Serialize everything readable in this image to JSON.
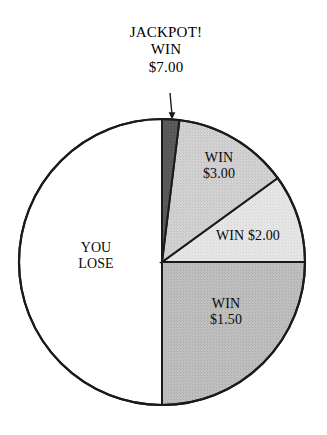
{
  "chart_data": {
    "type": "pie",
    "title": "",
    "legend_position": "none",
    "grid": false,
    "start_angle_deg": 0,
    "direction": "clockwise",
    "center": {
      "x": 162,
      "y": 262
    },
    "radius": 143,
    "total_degrees": 360,
    "categories": [
      "JACKPOT! WIN $7.00",
      "WIN $3.00",
      "WIN $2.00",
      "WIN $1.50",
      "YOU LOSE"
    ],
    "values": [
      7,
      47,
      36,
      90,
      180
    ],
    "value_unit": "degrees",
    "slices": [
      {
        "name": "jackpot",
        "label": "JACKPOT! WIN $7.00",
        "prize": "$7.00",
        "start_deg": 0,
        "end_deg": 7,
        "sweep_deg": 7,
        "fraction": 0.0194,
        "color": "#585858",
        "label_placement": "callout-above",
        "has_leader_line": true
      },
      {
        "name": "win-3",
        "label": "WIN $3.00",
        "prize": "$3.00",
        "start_deg": 7,
        "end_deg": 54,
        "sweep_deg": 47,
        "fraction": 0.1306,
        "color": "#cfcfcf",
        "label_placement": "inside"
      },
      {
        "name": "win-2",
        "label": "WIN $2.00",
        "prize": "$2.00",
        "start_deg": 54,
        "end_deg": 90,
        "sweep_deg": 36,
        "fraction": 0.1,
        "color": "#e4e4e4",
        "label_placement": "inside"
      },
      {
        "name": "win-150",
        "label": "WIN $1.50",
        "prize": "$1.50",
        "start_deg": 90,
        "end_deg": 180,
        "sweep_deg": 90,
        "fraction": 0.25,
        "color": "#bcbcbc",
        "label_placement": "inside"
      },
      {
        "name": "you-lose",
        "label": "YOU LOSE",
        "prize": "",
        "start_deg": 180,
        "end_deg": 360,
        "sweep_deg": 180,
        "fraction": 0.5,
        "color": "#ffffff",
        "label_placement": "inside"
      }
    ]
  },
  "callout": {
    "line1": "JACKPOT!",
    "line2": "WIN",
    "line3": "$7.00"
  },
  "labels": {
    "you_lose_line1": "YOU",
    "you_lose_line2": "LOSE",
    "win3_line1": "WIN",
    "win3_line2": "$3.00",
    "win2_line1": "WIN $2.00",
    "win150_line1": "WIN",
    "win150_line2": "$1.50"
  },
  "colors": {
    "outline": "#1a1a1a",
    "jackpot_fill": "#585858",
    "win3_fill": "#cfcfcf",
    "win2_fill": "#e4e4e4",
    "win150_fill": "#bcbcbc",
    "lose_fill": "#ffffff",
    "background": "#ffffff",
    "text": "#0a0a0a"
  }
}
